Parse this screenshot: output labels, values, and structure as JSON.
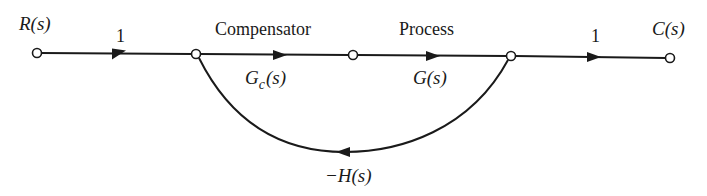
{
  "diagram": {
    "type": "signal-flow-graph",
    "nodes": [
      {
        "id": "R",
        "label": "R(s)",
        "x": 37,
        "y": 53
      },
      {
        "id": "N1",
        "label": "",
        "x": 196,
        "y": 54
      },
      {
        "id": "N2",
        "label": "",
        "x": 353,
        "y": 55
      },
      {
        "id": "N3",
        "label": "",
        "x": 511,
        "y": 56
      },
      {
        "id": "C",
        "label": "C(s)",
        "x": 670,
        "y": 58
      }
    ],
    "edges": [
      {
        "from": "R",
        "to": "N1",
        "gain": "1"
      },
      {
        "from": "N1",
        "to": "N2",
        "gain": "Gc(s)",
        "caption": "Compensator"
      },
      {
        "from": "N2",
        "to": "N3",
        "gain": "G(s)",
        "caption": "Process"
      },
      {
        "from": "N3",
        "to": "C",
        "gain": "1"
      },
      {
        "from": "N3",
        "to": "N1",
        "gain": "−H(s)",
        "kind": "feedback"
      }
    ]
  },
  "labels": {
    "input": "R(s)",
    "output": "C(s)",
    "gain_in": "1",
    "gain_out": "1",
    "compensator_caption": "Compensator",
    "compensator_gain_main": "G",
    "compensator_gain_sub": "c",
    "compensator_gain_arg": "(s)",
    "process_caption": "Process",
    "process_gain": "G(s)",
    "feedback_gain": "−H(s)"
  }
}
